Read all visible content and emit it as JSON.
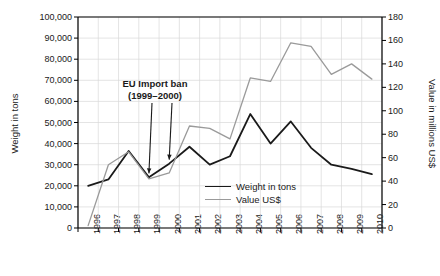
{
  "chart_data": {
    "type": "line",
    "title": "",
    "xlabel": "",
    "categories": [
      "1996",
      "1997",
      "1998",
      "1999",
      "2000",
      "2001",
      "2002",
      "2003",
      "2004",
      "2005",
      "2006",
      "2007",
      "2008",
      "2009",
      "2010"
    ],
    "grid": true,
    "legend_position": "inside-bottom-right",
    "axes": {
      "left": {
        "label": "Weight in tons",
        "min": 0,
        "max": 100000,
        "step": 10000,
        "ticks": [
          "0",
          "10,000",
          "20,000",
          "30,000",
          "40,000",
          "50,000",
          "60,000",
          "70,000",
          "80,000",
          "90,000",
          "100,000"
        ]
      },
      "right": {
        "label": "Value in millions US$",
        "min": 0,
        "max": 180,
        "step": 20,
        "ticks": [
          "0",
          "20",
          "40",
          "60",
          "80",
          "100",
          "120",
          "140",
          "160",
          "180"
        ]
      }
    },
    "series": [
      {
        "name": "Weight in tons",
        "axis": "left",
        "color": "#1a1a1a",
        "values": [
          20000,
          23000,
          36500,
          24000,
          30500,
          38500,
          30000,
          34000,
          54000,
          40000,
          50500,
          38000,
          30000,
          28000,
          25500
        ]
      },
      {
        "name": "Value US$",
        "axis": "right",
        "color": "#9a9a9a",
        "values": [
          2,
          54,
          65,
          42,
          47,
          87,
          85,
          76,
          128,
          125,
          158,
          155,
          131,
          140,
          127
        ]
      }
    ],
    "annotations": [
      {
        "line1": "EU Import ban",
        "line2": "(1999–2000)",
        "arrow_targets": [
          "1999",
          "2000"
        ]
      }
    ]
  },
  "legend": {
    "items": [
      {
        "label": "Weight in tons",
        "color": "#1a1a1a"
      },
      {
        "label": "Value US$",
        "color": "#9a9a9a"
      }
    ]
  }
}
